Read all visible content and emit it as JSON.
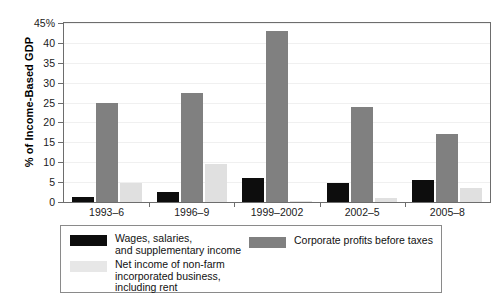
{
  "chart_data": {
    "type": "bar",
    "title": "",
    "xlabel": "",
    "ylabel": "% of Income-Based GDP",
    "ylim": [
      0,
      45
    ],
    "ytick_values": [
      0,
      5,
      10,
      15,
      20,
      25,
      30,
      35,
      40,
      45
    ],
    "ytick_labels": [
      "0",
      "5",
      "10",
      "15",
      "20",
      "25",
      "30",
      "35",
      "40",
      "45%"
    ],
    "grid": true,
    "legend_position": "below-plot",
    "categories": [
      "1993–6",
      "1996–9",
      "1999–2002",
      "2002–5",
      "2005–8"
    ],
    "series": [
      {
        "name": "Wages, salaries,\nand supplementary income",
        "color": "#0d0d0d",
        "values": [
          1.3,
          2.5,
          6.0,
          4.8,
          5.5
        ]
      },
      {
        "name": "Corporate profits before taxes",
        "color": "#808080",
        "values": [
          24.8,
          27.3,
          43.0,
          24.0,
          17.0
        ]
      },
      {
        "name": "Net income of non-farm\nincorporated business,\nincluding rent",
        "color": "#e0e0e0",
        "values": [
          4.9,
          9.5,
          0.2,
          1.0,
          3.4
        ]
      }
    ]
  },
  "axis": {
    "y_title": "% of Income-Based GDP"
  },
  "legend": {
    "entries": [
      {
        "label": "Wages, salaries,\nand supplementary income",
        "swatch": "black-swatch"
      },
      {
        "label": "Corporate profits before taxes",
        "swatch": "gray-swatch"
      },
      {
        "label": "Net income of non-farm\nincorporated business,\nincluding rent",
        "swatch": "light-gray-swatch"
      }
    ]
  }
}
